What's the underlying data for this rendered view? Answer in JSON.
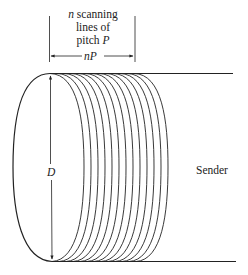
{
  "diagram": {
    "title_lines": {
      "line1_var": "n",
      "line1_text": " scanning",
      "line2_text": "lines of",
      "line3_text": "pitch ",
      "line3_var": "P"
    },
    "dimension_label": {
      "var": "nP"
    },
    "diameter_label": "D",
    "side_label": "Sender",
    "scanning_line_count": 13,
    "colors": {
      "stroke": "#222222",
      "background": "#ffffff"
    }
  }
}
